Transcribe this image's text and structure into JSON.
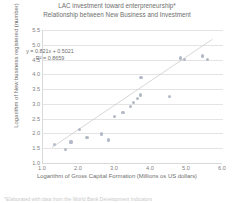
{
  "chart_data": {
    "type": "scatter",
    "title": "LAC investment toward enterpreneurship*",
    "subtitle": "Relationship between New Business and Investment",
    "xlabel": "Logarithm of Gross Capital Formation (Millions os US dollars)",
    "ylabel": "Logarithm of New business registered (number)",
    "xlim": [
      1.0,
      6.0
    ],
    "ylim": [
      1.0,
      5.5
    ],
    "xticks": [
      "1.0",
      "2.0",
      "3.0",
      "4.0",
      "5.0",
      "6.0"
    ],
    "yticks": [
      "1.0",
      "1.5",
      "2.0",
      "2.5",
      "3.0",
      "3.5",
      "4.0",
      "4.5",
      "5.0",
      "5.5"
    ],
    "grid": "horizontal",
    "legend": "none",
    "marker_color": "#b3b9c6",
    "trendline_color": "#c6c6c6",
    "annotations": {
      "equation": "y = 0.821x + 0.5021",
      "r_squared": "R² = 0.8659"
    },
    "trendline": {
      "slope": 0.821,
      "intercept": 0.5021,
      "x_start": 1.25,
      "x_end": 5.7
    },
    "points": [
      {
        "x": 1.32,
        "y": 1.63
      },
      {
        "x": 1.62,
        "y": 1.45
      },
      {
        "x": 1.78,
        "y": 1.71
      },
      {
        "x": 2.02,
        "y": 2.12
      },
      {
        "x": 2.22,
        "y": 1.85
      },
      {
        "x": 2.62,
        "y": 1.98
      },
      {
        "x": 2.82,
        "y": 1.78
      },
      {
        "x": 2.98,
        "y": 2.58
      },
      {
        "x": 3.22,
        "y": 2.72
      },
      {
        "x": 3.42,
        "y": 2.92
      },
      {
        "x": 3.52,
        "y": 3.04
      },
      {
        "x": 3.62,
        "y": 3.18
      },
      {
        "x": 3.7,
        "y": 3.3
      },
      {
        "x": 3.72,
        "y": 3.88
      },
      {
        "x": 4.52,
        "y": 3.25
      },
      {
        "x": 4.82,
        "y": 4.55
      },
      {
        "x": 4.92,
        "y": 4.5
      },
      {
        "x": 5.42,
        "y": 4.62
      },
      {
        "x": 5.58,
        "y": 4.5
      }
    ]
  },
  "footnote": {
    "text": "*Elaborated with data from the World Bank Development Indicators"
  }
}
